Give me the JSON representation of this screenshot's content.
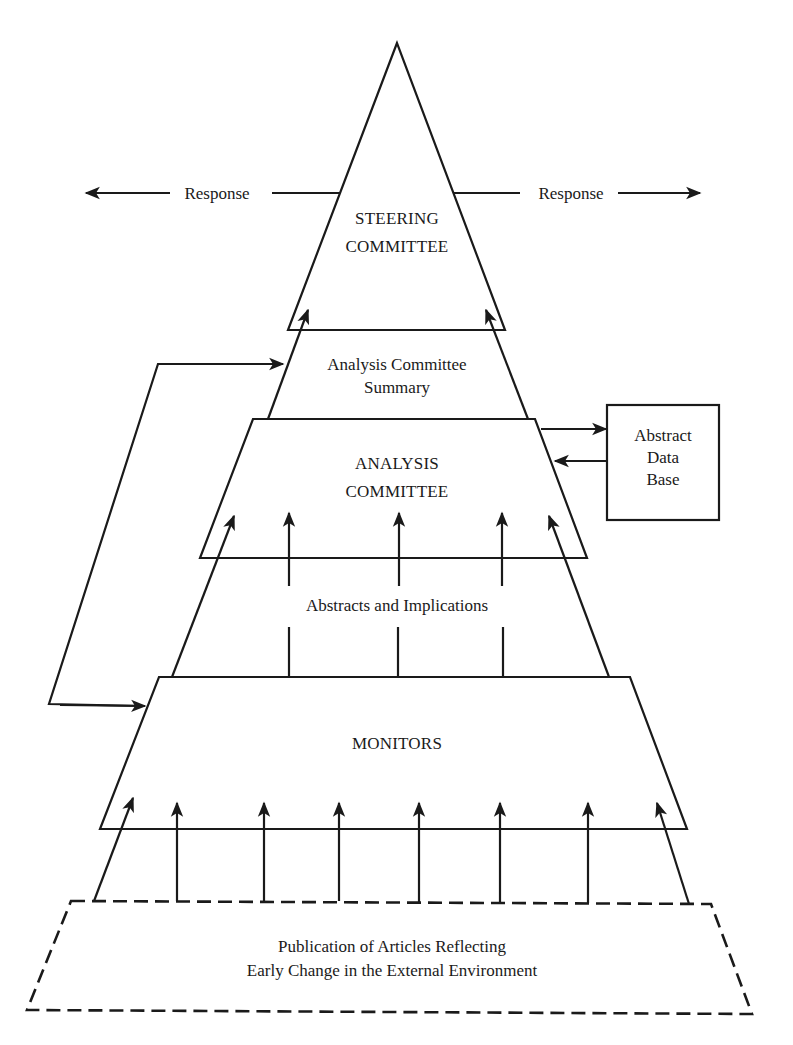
{
  "diagram": {
    "type": "hierarchical pyramid flow diagram",
    "colors": {
      "ink": "#1a1a1a",
      "background": "#ffffff"
    },
    "response_left": {
      "label": "Response",
      "direction": "left"
    },
    "response_right": {
      "label": "Response",
      "direction": "right"
    },
    "steering_committee": {
      "line1": "STEERING",
      "line2": "COMMITTEE"
    },
    "analysis_summary": {
      "line1": "Analysis Committee",
      "line2": "Summary"
    },
    "analysis_committee": {
      "line1": "ANALYSIS",
      "line2": "COMMITTEE"
    },
    "abstract_data_base": {
      "line1": "Abstract",
      "line2": "Data",
      "line3": "Base"
    },
    "abstracts_implications": {
      "label": "Abstracts and Implications"
    },
    "monitors": {
      "label": "MONITORS"
    },
    "publication": {
      "line1": "Publication of Articles Reflecting",
      "line2": "Early Change in the External Environment"
    },
    "flows": [
      "Publication of Articles -> MONITORS (8 arrows)",
      "Abstracts and Implications -> ANALYSIS COMMITTEE (5 arrows)",
      "ANALYSIS COMMITTEE <-> Abstract Data Base",
      "Analysis Committee Summary -> STEERING COMMITTEE (2 arrows)",
      "Feedback loop: MONITORS <-> Analysis Committee Summary",
      "STEERING COMMITTEE -> Response (left and right)"
    ]
  }
}
